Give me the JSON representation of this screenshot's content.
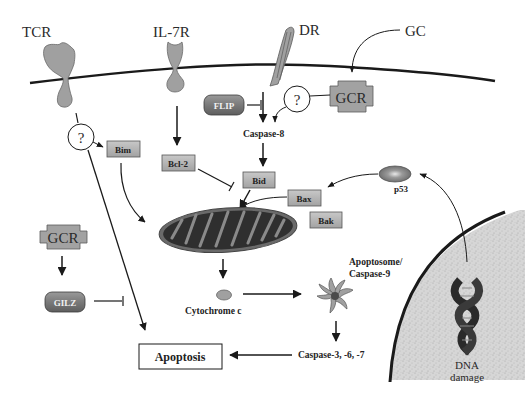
{
  "diagram": {
    "receptors": {
      "tcr": "TCR",
      "il7r": "IL-7R",
      "dr": "DR",
      "gc": "GC"
    },
    "nodes": {
      "gcr_top": "GCR",
      "gcr_left": "GCR",
      "question_left": "?",
      "question_right": "?",
      "flip": "FLIP",
      "caspase8": "Caspase-8",
      "bim": "Bim",
      "bcl2": "Bcl-2",
      "bid": "Bid",
      "bax": "Bax",
      "bak": "Bak",
      "p53": "p53",
      "gilz": "GILZ",
      "cytochrome_c": "Cytochrome c",
      "apoptosome_line1": "Apoptosome/",
      "apoptosome_line2": "Caspase-9",
      "caspase367": "Caspase-3, -6, -7",
      "apoptosis": "Apoptosis",
      "dna_line1": "DNA",
      "dna_line2": "damage"
    },
    "colors": {
      "membrane": "#1a1a1a",
      "receptor_fill": "#a0a0a0",
      "box_fill": "#b4b4b4",
      "mito_outer": "#5a5a5a",
      "mito_inner": "#2e2e2e",
      "nucleus_fill": "#d4d4d4"
    }
  }
}
